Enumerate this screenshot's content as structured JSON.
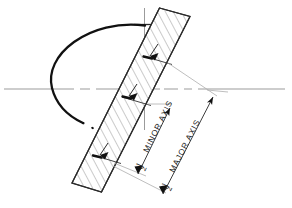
{
  "figure": {
    "type": "engineering-drawing",
    "background_color": "#ffffff",
    "ink_color": "#1a1a1a",
    "centerline_color": "#8a8a8a",
    "thin_line_color": "#9a9a9a"
  },
  "labels": {
    "minor_axis": {
      "fraction": "1",
      "denominator": "2",
      "text": "MINOR AXIS",
      "full": "1/2 MINOR AXIS"
    },
    "major_axis": {
      "fraction": "1",
      "denominator": "2",
      "text": "MAJOR AXIS",
      "full": "1/2 MAJOR AXIS"
    }
  },
  "elements": {
    "ellipse_arc": "bold-elliptical-arc",
    "ellipse_arc_dotted_tail": "dotted-arc-continuation",
    "trammel_strip": "hatched-rotated-band",
    "horizontal_centerline": "dash-dot-horizontal-axis",
    "vertical_centerline": "vertical-axis",
    "minor_axis_dimension": "dimension-line-with-arrowheads",
    "major_axis_dimension": "dimension-line-with-arrowheads",
    "strip_mark_major": "tick-arrow-on-strip-major",
    "strip_mark_minor": "tick-arrow-on-strip-minor"
  }
}
